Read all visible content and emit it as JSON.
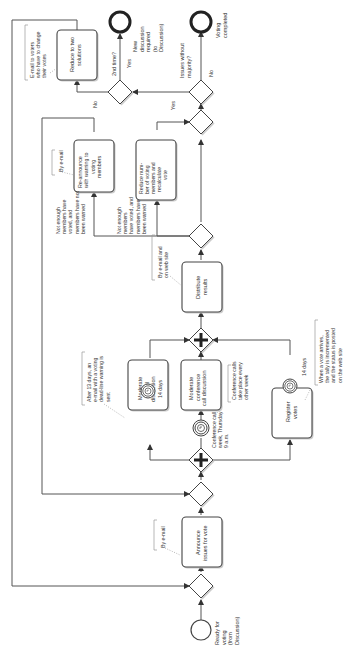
{
  "diagram": {
    "type": "BPMN process",
    "orientation": "rotated 90deg counter-clockwise",
    "colors": {
      "stroke": "#444444",
      "text": "#333333",
      "shadow": "#cccccc",
      "background": "#ffffff"
    },
    "events": {
      "start": {
        "label": [
          "Ready for",
          "voting",
          "(from",
          "Discussion)"
        ]
      },
      "end_new_discussion": {
        "label": [
          "New",
          "discussion",
          "required",
          "(to",
          "Discussion)"
        ]
      },
      "end_voting_completed": {
        "label": [
          "Voting",
          "completed"
        ]
      },
      "timer_conference": {
        "label": [
          "Conference call",
          "week, Thursday",
          "9 a.m."
        ]
      }
    },
    "tasks": {
      "announce": {
        "label": [
          "Announce",
          "issues for vote"
        ]
      },
      "moderate_email": {
        "label": [
          "Moderate",
          "e-mail",
          "discussion"
        ],
        "timer": "14 days"
      },
      "moderate_conference": {
        "label": [
          "Moderate",
          "conference",
          "call discussion"
        ]
      },
      "register_votes": {
        "label": [
          "Register",
          "votes"
        ],
        "timer": "14 days"
      },
      "distribute": {
        "label": [
          "Distribute",
          "results"
        ]
      },
      "reannounce": {
        "label": [
          "Re-announce",
          "with warning to",
          "voting",
          "members"
        ]
      },
      "reduce_members": {
        "label": [
          "Reduce num-",
          "ber of voting",
          "members and",
          "recalculate",
          "vote"
        ]
      },
      "reduce_solutions": {
        "label": [
          "Reduce to two",
          "solutions"
        ]
      }
    },
    "gateways": {
      "issues_without_majority": {
        "label": [
          "Issues without",
          "majority?"
        ]
      },
      "second_time": {
        "label": [
          "2nd time?"
        ]
      }
    },
    "flow_labels": {
      "yes1": "Yes",
      "no1": "No",
      "yes2": "Yes",
      "no2": "No"
    },
    "condition_labels": {
      "not_enough_not_warned": [
        "Not enough",
        "members have",
        "voted, and",
        "members have not",
        "been warned"
      ],
      "not_enough_warned": [
        "Not enough",
        "members",
        "have voted, and",
        "members have",
        "been warned"
      ]
    },
    "annotations": {
      "by_email_1": [
        "By e-mail"
      ],
      "by_email_2": [
        "By e-mail"
      ],
      "by_email_web": [
        "By e-mail and",
        "on web site"
      ],
      "after_13_days": [
        "After 13 days, an",
        "e-mail with a voting",
        "dead-line warning is",
        "sent"
      ],
      "conference_calls": [
        "Conference calls",
        "take place every",
        "other week"
      ],
      "vote_arrives": [
        "When a vote arrives,",
        "the tally is incremented",
        "and the status is posted",
        "on the web site"
      ],
      "email_voters": [
        "E-mail to voters",
        "who have to change",
        "their votes"
      ]
    }
  }
}
